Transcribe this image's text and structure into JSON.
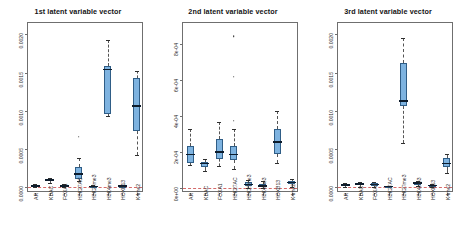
{
  "figure": {
    "width": 466,
    "height": 244,
    "background": "#ffffff",
    "box_fill": "#7eb3e0",
    "box_border": "#2f5d86",
    "median_color": "#0d1c2c",
    "zero_line_color": "#d46a6a"
  },
  "chart_data": [
    {
      "type": "box",
      "title": "1st latent variable vector",
      "xlabel": "",
      "ylabel": "",
      "ylim": [
        -8e-05,
        0.00215
      ],
      "grid": false,
      "legend": "none",
      "yticks": [
        0.0,
        0.0005,
        0.001,
        0.0015,
        0.002
      ],
      "ytick_labels": [
        "0.0000",
        "0.0005",
        "0.0010",
        "0.0015",
        "0.0020"
      ],
      "categories": [
        "AR",
        "KDAC",
        "FOXA1",
        "H3K27AC",
        "H3K27me3",
        "H3K4me3",
        "HOXB13",
        "K4me2"
      ],
      "boxes": [
        {
          "category": "AR",
          "whisker_low": 0.0,
          "q1": 0.0,
          "median": 1e-05,
          "q3": 2e-05,
          "whisker_high": 3.5e-05,
          "outliers": []
        },
        {
          "category": "KDAC",
          "whisker_low": 5.5e-05,
          "q1": 7.5e-05,
          "median": 9e-05,
          "q3": 0.000105,
          "whisker_high": 0.00012,
          "outliers": []
        },
        {
          "category": "FOXA1",
          "whisker_low": 0.0,
          "q1": 5e-06,
          "median": 1.5e-05,
          "q3": 2.5e-05,
          "whisker_high": 3.5e-05,
          "outliers": []
        },
        {
          "category": "H3K27AC",
          "whisker_low": 7.5e-05,
          "q1": 0.00011,
          "median": 0.00017,
          "q3": 0.00026,
          "whisker_high": 0.00038,
          "outliers": [
            0.00066
          ]
        },
        {
          "category": "H3K27me3",
          "whisker_low": 0.0,
          "q1": 2e-06,
          "median": 6e-06,
          "q3": 1.2e-05,
          "whisker_high": 2e-05,
          "outliers": []
        },
        {
          "category": "H3K4me3",
          "whisker_low": 0.00093,
          "q1": 0.00096,
          "median": 0.00154,
          "q3": 0.00158,
          "whisker_high": 0.00193,
          "outliers": []
        },
        {
          "category": "HOXB13",
          "whisker_low": 0.0,
          "q1": 4e-06,
          "median": 1e-05,
          "q3": 1.8e-05,
          "whisker_high": 2.8e-05,
          "outliers": []
        },
        {
          "category": "K4me2",
          "whisker_low": 0.00042,
          "q1": 0.00073,
          "median": 0.00106,
          "q3": 0.00143,
          "whisker_high": 0.00152,
          "outliers": []
        }
      ]
    },
    {
      "type": "box",
      "title": "2nd latent variable vector",
      "xlabel": "",
      "ylabel": "",
      "ylim": [
        -3e-05,
        0.00092
      ],
      "grid": false,
      "legend": "none",
      "yticks": [
        0.0,
        0.0002,
        0.0004,
        0.0006,
        0.0008
      ],
      "ytick_labels": [
        "0e+00",
        "2e-04",
        "4e-04",
        "6e-04",
        "8e-04"
      ],
      "categories": [
        "AR",
        "KDAC",
        "FOXA1",
        "H3K27AC",
        "H3K27me3",
        "H3K4me3",
        "HOXB13",
        "K4me2"
      ],
      "boxes": [
        {
          "category": "AR",
          "whisker_low": 0.000125,
          "q1": 0.00014,
          "median": 0.000185,
          "q3": 0.000235,
          "whisker_high": 0.00033,
          "outliers": []
        },
        {
          "category": "KDAC",
          "whisker_low": 9.5e-05,
          "q1": 0.000115,
          "median": 0.000135,
          "q3": 0.000145,
          "whisker_high": 0.00016,
          "outliers": []
        },
        {
          "category": "FOXA1",
          "whisker_low": 0.00012,
          "q1": 0.00016,
          "median": 0.0002,
          "q3": 0.00027,
          "whisker_high": 0.000365,
          "outliers": []
        },
        {
          "category": "H3K27AC",
          "whisker_low": 0.000105,
          "q1": 0.000155,
          "median": 0.000185,
          "q3": 0.000235,
          "whisker_high": 0.00033,
          "outliers": [
            0.000375,
            0.00062,
            0.000845
          ]
        },
        {
          "category": "H3K27me3",
          "whisker_low": 0.0,
          "q1": 8e-06,
          "median": 1.8e-05,
          "q3": 3e-05,
          "whisker_high": 4.2e-05,
          "outliers": []
        },
        {
          "category": "H3K4me3",
          "whisker_low": 0.0,
          "q1": 4e-06,
          "median": 1e-05,
          "q3": 2.2e-05,
          "whisker_high": 3.5e-05,
          "outliers": []
        },
        {
          "category": "HOXB13",
          "whisker_low": 0.000135,
          "q1": 0.00019,
          "median": 0.000255,
          "q3": 0.000325,
          "whisker_high": 0.00043,
          "outliers": []
        },
        {
          "category": "K4me2",
          "whisker_low": 5e-06,
          "q1": 1.8e-05,
          "median": 2.8e-05,
          "q3": 3.8e-05,
          "whisker_high": 5e-05,
          "outliers": []
        }
      ]
    },
    {
      "type": "box",
      "title": "3rd latent variable vector",
      "xlabel": "",
      "ylabel": "",
      "ylim": [
        -8e-05,
        0.00215
      ],
      "grid": false,
      "legend": "none",
      "yticks": [
        0.0,
        0.0005,
        0.001,
        0.0015,
        0.002
      ],
      "ytick_labels": [
        "0.0000",
        "0.0005",
        "0.0010",
        "0.0015",
        "0.0020"
      ],
      "categories": [
        "AR",
        "KDAC",
        "FOXA1",
        "H3K27AC",
        "H3K27me3",
        "H3K4me3",
        "HOXB13",
        "K4me2"
      ],
      "boxes": [
        {
          "category": "AR",
          "whisker_low": 0.0,
          "q1": 1e-05,
          "median": 2.5e-05,
          "q3": 4e-05,
          "whisker_high": 5.5e-05,
          "outliers": []
        },
        {
          "category": "KDAC",
          "whisker_low": 5e-06,
          "q1": 2e-05,
          "median": 4e-05,
          "q3": 5.5e-05,
          "whisker_high": 7e-05,
          "outliers": []
        },
        {
          "category": "FOXA1",
          "whisker_low": 2e-06,
          "q1": 1.5e-05,
          "median": 3e-05,
          "q3": 4.5e-05,
          "whisker_high": 6e-05,
          "outliers": []
        },
        {
          "category": "H3K27AC",
          "whisker_low": 0.0,
          "q1": 2e-06,
          "median": 6e-06,
          "q3": 1.2e-05,
          "whisker_high": 1.8e-05,
          "outliers": []
        },
        {
          "category": "H3K27me3",
          "whisker_low": 0.00058,
          "q1": 0.00106,
          "median": 0.00113,
          "q3": 0.00162,
          "whisker_high": 0.00195,
          "outliers": []
        },
        {
          "category": "H3K4me3",
          "whisker_low": 1e-05,
          "q1": 3e-05,
          "median": 4.8e-05,
          "q3": 6.2e-05,
          "whisker_high": 8e-05,
          "outliers": []
        },
        {
          "category": "HOXB13",
          "whisker_low": 0.0,
          "q1": 6e-06,
          "median": 1.8e-05,
          "q3": 3e-05,
          "whisker_high": 4.2e-05,
          "outliers": []
        },
        {
          "category": "K4me2",
          "whisker_low": 0.00018,
          "q1": 0.00026,
          "median": 0.000305,
          "q3": 0.00038,
          "whisker_high": 0.00043,
          "outliers": []
        }
      ]
    }
  ]
}
